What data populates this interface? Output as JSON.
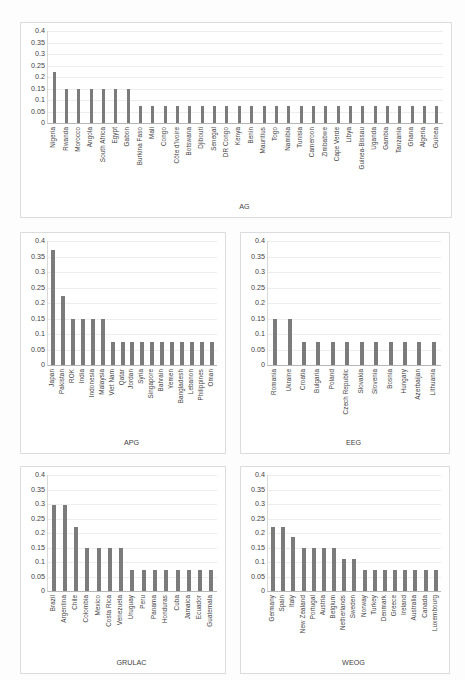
{
  "chart_data": [
    {
      "id": "ag",
      "type": "bar",
      "title": "",
      "xlabel": "AG",
      "ylabel": "",
      "ylim": [
        0,
        0.4
      ],
      "yticks": [
        0,
        0.05,
        0.1,
        0.15,
        0.2,
        0.25,
        0.3,
        0.35,
        0.4
      ],
      "ytick_labels": [
        "0",
        "0.05",
        "0.1",
        "0.15",
        "0.2",
        "0.25",
        "0.3",
        "0.35",
        "0.4"
      ],
      "grid": true,
      "legend": "none",
      "categories": [
        "Nigeria",
        "Rwanda",
        "Morocco",
        "Angola",
        "South Africa",
        "Egypt",
        "Gabon",
        "Burkina Faso",
        "Mali",
        "Congo",
        "Côte d'Ivoire",
        "Botswana",
        "Djibouti",
        "Senegal",
        "DR Congo",
        "Kenya",
        "Benin",
        "Mauritius",
        "Togo",
        "Namibia",
        "Tunisia",
        "Cameroon",
        "Zimbabwe",
        "Cape Verde",
        "Libya",
        "Guinea-Bissau",
        "Uganda",
        "Gambia",
        "Tanzania",
        "Ghana",
        "Algeria",
        "Guinea"
      ],
      "values": [
        0.222,
        0.148,
        0.148,
        0.148,
        0.148,
        0.148,
        0.148,
        0.074,
        0.074,
        0.074,
        0.074,
        0.074,
        0.074,
        0.074,
        0.074,
        0.074,
        0.074,
        0.074,
        0.074,
        0.074,
        0.074,
        0.074,
        0.074,
        0.074,
        0.074,
        0.074,
        0.074,
        0.074,
        0.074,
        0.074,
        0.074,
        0.074
      ]
    },
    {
      "id": "apg",
      "type": "bar",
      "title": "",
      "xlabel": "APG",
      "ylabel": "",
      "ylim": [
        0,
        0.4
      ],
      "yticks": [
        0,
        0.05,
        0.1,
        0.15,
        0.2,
        0.25,
        0.3,
        0.35,
        0.4
      ],
      "ytick_labels": [
        "0",
        "0.05",
        "0.1",
        "0.15",
        "0.2",
        "0.25",
        "0.3",
        "0.35",
        "0.4"
      ],
      "grid": true,
      "legend": "none",
      "categories": [
        "Japan",
        "Pakistan",
        "ROK",
        "India",
        "Indonesia",
        "Malaysia",
        "Viet Nam",
        "Qatar",
        "Jordan",
        "Syria",
        "Singapore",
        "Bahrain",
        "Yemen",
        "Bangladesh",
        "Lebanon",
        "Philippines",
        "Oman"
      ],
      "values": [
        0.37,
        0.222,
        0.148,
        0.148,
        0.148,
        0.148,
        0.074,
        0.074,
        0.074,
        0.074,
        0.074,
        0.074,
        0.074,
        0.074,
        0.074,
        0.074,
        0.074
      ]
    },
    {
      "id": "eeg",
      "type": "bar",
      "title": "",
      "xlabel": "EEG",
      "ylabel": "",
      "ylim": [
        0,
        0.4
      ],
      "yticks": [
        0,
        0.05,
        0.1,
        0.15,
        0.2,
        0.25,
        0.3,
        0.35,
        0.4
      ],
      "ytick_labels": [
        "0",
        "0.05",
        "0.1",
        "0.15",
        "0.2",
        "0.25",
        "0.3",
        "0.35",
        "0.4"
      ],
      "grid": true,
      "legend": "none",
      "categories": [
        "Romania",
        "Ukraine",
        "Croatia",
        "Bulgaria",
        "Poland",
        "Czech Republic",
        "Slovakia",
        "Slovenia",
        "Bosnia",
        "Hungary",
        "Azerbaijan",
        "Lithuania"
      ],
      "values": [
        0.148,
        0.148,
        0.074,
        0.074,
        0.074,
        0.074,
        0.074,
        0.074,
        0.074,
        0.074,
        0.074,
        0.074
      ]
    },
    {
      "id": "grulac",
      "type": "bar",
      "title": "",
      "xlabel": "GRULAC",
      "ylabel": "",
      "ylim": [
        0,
        0.4
      ],
      "yticks": [
        0,
        0.05,
        0.1,
        0.15,
        0.2,
        0.25,
        0.3,
        0.35,
        0.4
      ],
      "ytick_labels": [
        "0",
        "0.05",
        "0.1",
        "0.15",
        "0.2",
        "0.25",
        "0.3",
        "0.35",
        "0.4"
      ],
      "grid": true,
      "legend": "none",
      "categories": [
        "Brazil",
        "Argentina",
        "Chile",
        "Colombia",
        "Mexico",
        "Costa Rica",
        "Venezuela",
        "Uruguay",
        "Peru",
        "Panama",
        "Honduras",
        "Cuba",
        "Jamaica",
        "Ecuador",
        "Guatemala"
      ],
      "values": [
        0.296,
        0.296,
        0.222,
        0.148,
        0.148,
        0.148,
        0.148,
        0.074,
        0.074,
        0.074,
        0.074,
        0.074,
        0.074,
        0.074,
        0.074
      ]
    },
    {
      "id": "weog",
      "type": "bar",
      "title": "",
      "xlabel": "WEOG",
      "ylabel": "",
      "ylim": [
        0,
        0.4
      ],
      "yticks": [
        0,
        0.05,
        0.1,
        0.15,
        0.2,
        0.25,
        0.3,
        0.35,
        0.4
      ],
      "ytick_labels": [
        "0",
        "0.05",
        "0.1",
        "0.15",
        "0.2",
        "0.25",
        "0.3",
        "0.35",
        "0.4"
      ],
      "grid": true,
      "legend": "none",
      "categories": [
        "Germany",
        "Spain",
        "Italy",
        "New Zealand",
        "Portugal",
        "Austria",
        "Belgium",
        "Netherlands",
        "Sweden",
        "Norway",
        "Turkey",
        "Denmark",
        "Greece",
        "Ireland",
        "Australia",
        "Canada",
        "Luxembourg"
      ],
      "values": [
        0.222,
        0.222,
        0.185,
        0.148,
        0.148,
        0.148,
        0.148,
        0.111,
        0.111,
        0.074,
        0.074,
        0.074,
        0.074,
        0.074,
        0.074,
        0.074,
        0.074
      ]
    }
  ],
  "style": {
    "bar_color": "#7b7b7b",
    "grid_color": "#ededed",
    "axis_color": "#b6b6b6",
    "text_color": "#3f3f3f",
    "panel_border": "#dcdcdc",
    "background": "#ffffff"
  }
}
